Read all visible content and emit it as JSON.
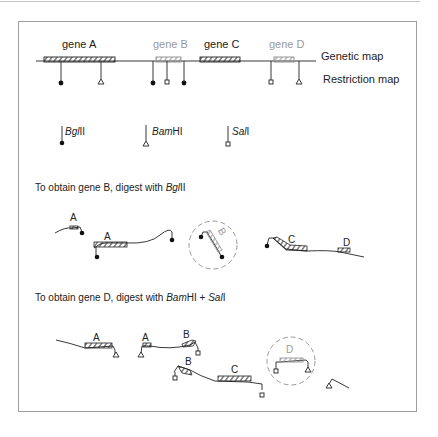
{
  "figure": {
    "genetic_map_label": "Genetic map",
    "restriction_map_label": "Restriction map",
    "genes": [
      {
        "name": "gene A",
        "highlight": false
      },
      {
        "name": "gene B",
        "highlight": true
      },
      {
        "name": "gene C",
        "highlight": false
      },
      {
        "name": "gene D",
        "highlight": true
      }
    ],
    "legend": [
      {
        "enzyme_italic": "Bgl",
        "enzyme_suffix": "II",
        "symbol": "filled-circle"
      },
      {
        "enzyme_italic": "Bam",
        "enzyme_suffix": "HI",
        "symbol": "open-triangle"
      },
      {
        "enzyme_italic": "Sal",
        "enzyme_suffix": "I",
        "symbol": "open-square"
      }
    ],
    "section1": {
      "caption_prefix": "To obtain gene B, digest with ",
      "caption_italic": "Bgl",
      "caption_suffix": "II",
      "fragment_labels": [
        "A",
        "A",
        "B",
        "C",
        "D"
      ]
    },
    "section2": {
      "caption_prefix": "To obtain gene D, digest with ",
      "caption_italic1": "Bam",
      "caption_mid": "HI + ",
      "caption_italic2": "Sal",
      "caption_suffix": "I",
      "fragment_labels": [
        "A",
        "A",
        "B",
        "B",
        "C",
        "D"
      ]
    },
    "colors": {
      "ink": "#222222",
      "highlight_grey": "#9a9a9a",
      "frame": "#9e9e9e"
    }
  }
}
